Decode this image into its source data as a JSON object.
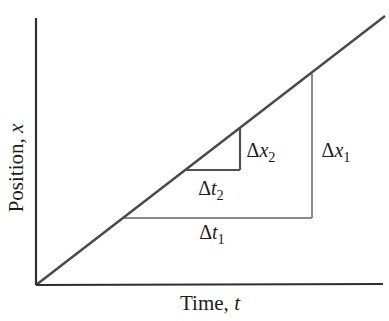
{
  "figure": {
    "background": "#ffffff",
    "text_color": "#1b1b1b",
    "y_axis_label": {
      "text": "Position,",
      "var": "x"
    },
    "x_axis_label": {
      "text": "Time,",
      "var": "t"
    },
    "annotations": {
      "dx1": {
        "delta": "Δ",
        "var": "x",
        "sub": "1"
      },
      "dt1": {
        "delta": "Δ",
        "var": "t",
        "sub": "1"
      },
      "dx2": {
        "delta": "Δ",
        "var": "x",
        "sub": "2"
      },
      "dt2": {
        "delta": "Δ",
        "var": "t",
        "sub": "2"
      }
    },
    "lines": {
      "y_axis": {
        "x1": 36,
        "y1": 18,
        "x2": 36,
        "y2": 285,
        "color": "#2f2f2f",
        "width": 2.2
      },
      "x_axis": {
        "x1": 36,
        "y1": 285,
        "x2": 383,
        "y2": 284,
        "color": "#2f2f2f",
        "width": 2.2
      },
      "position_line": {
        "x1": 36,
        "y1": 285,
        "x2": 385,
        "y2": 16,
        "color": "#4a4a4a",
        "width": 2.5
      },
      "dt1_base": {
        "x1": 123,
        "y1": 218,
        "x2": 312,
        "y2": 218,
        "color": "#8a8a8a",
        "width": 2
      },
      "dx1_rise": {
        "x1": 312,
        "y1": 218,
        "x2": 312,
        "y2": 74,
        "color": "#8a8a8a",
        "width": 2
      },
      "dt2_base": {
        "x1": 186,
        "y1": 170,
        "x2": 240,
        "y2": 170,
        "color": "#4f4f4f",
        "width": 2.2
      },
      "dx2_rise": {
        "x1": 240,
        "y1": 170,
        "x2": 240,
        "y2": 128,
        "color": "#4f4f4f",
        "width": 2.2
      }
    }
  }
}
